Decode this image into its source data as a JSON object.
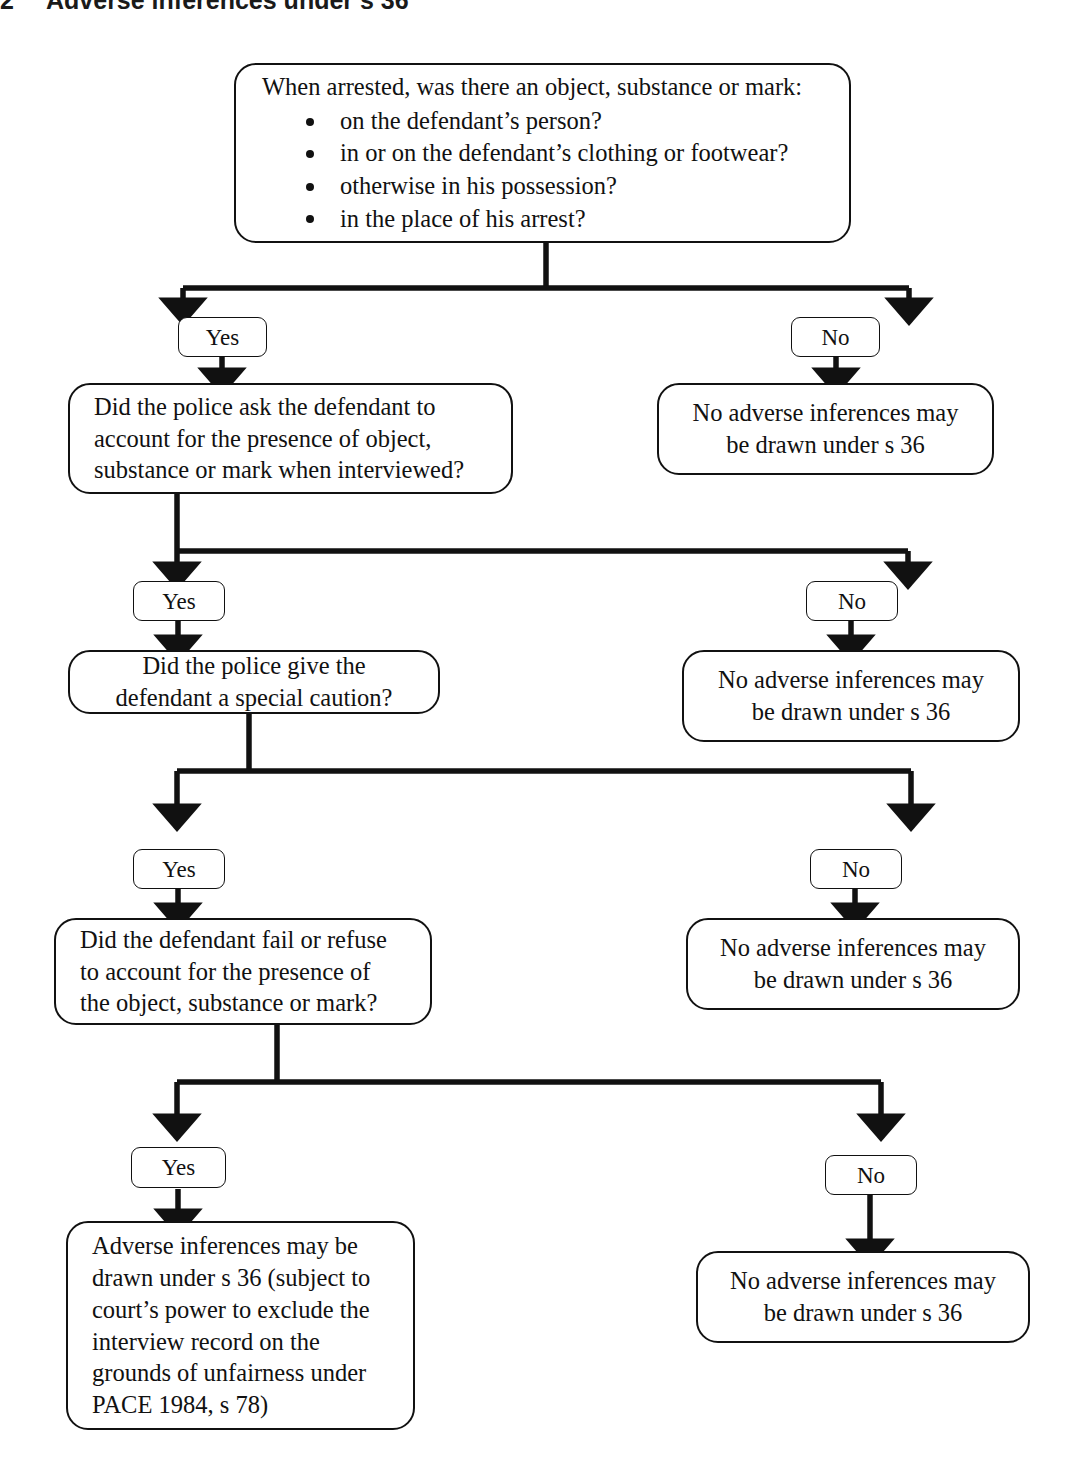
{
  "page": {
    "heading_number": "2",
    "heading_title": "Adverse inferences under s 36",
    "background_color": "#ffffff",
    "line_color": "#111111"
  },
  "flowchart": {
    "type": "decision-tree",
    "nodes": {
      "root": {
        "lead": "When arrested, was there an object, substance or mark:",
        "bullets": [
          "on the defendant’s person?",
          "in or on the defendant’s clothing or footwear?",
          "otherwise in his possession?",
          "in the place of his arrest?"
        ]
      },
      "q2": "Did the police ask the defendant to account for the presence of object, substance or mark when interviewed?",
      "q3": "Did the police give the defendant a special caution?",
      "q4": "Did the defendant fail or refuse to account for the presence of the object, substance or mark?",
      "outcome_no_1": "No adverse inferences may be drawn under s 36",
      "outcome_no_2": "No adverse inferences may be drawn under s 36",
      "outcome_no_3": "No adverse inferences may be drawn under s 36",
      "outcome_no_4": "No adverse inferences may be drawn under s 36",
      "outcome_yes_final": "Adverse inferences may be drawn under s 36 (subject to court’s power to exclude the interview record on the grounds of unfairness under PACE 1984, s 78)"
    },
    "branch_labels": {
      "yes_1": "Yes",
      "no_1": "No",
      "yes_2": "Yes",
      "no_2": "No",
      "yes_3": "Yes",
      "no_3": "No",
      "yes_4": "Yes",
      "no_4": "No"
    }
  }
}
